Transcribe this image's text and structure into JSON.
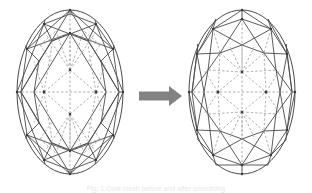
{
  "figure": {
    "background_color": "#ffffff",
    "line_color": "#4a4a4a",
    "dashed_color": "#9a9a9a",
    "arrow_color": "#828282",
    "caption": "Fig. 1  Oval mesh before and after smoothing",
    "panels": [
      {
        "id": "before",
        "name": "left-oval-mesh",
        "label": "Initial oval triangular mesh",
        "mesh_density": "fine",
        "ellipse": {
          "cx": 70,
          "cy": 92,
          "rx": 53,
          "ry": 82
        },
        "rings": [
          1.0,
          0.78,
          0.5,
          0.22
        ],
        "sectors": 12,
        "node_count": 37
      },
      {
        "id": "after",
        "name": "right-oval-mesh",
        "label": "Smoothed oval triangular mesh",
        "mesh_density": "coarse",
        "ellipse": {
          "cx": 70,
          "cy": 92,
          "rx": 53,
          "ry": 82
        },
        "rings": [
          1.0,
          0.8,
          0.56,
          0.28
        ],
        "sectors": 12,
        "node_count": 31
      }
    ],
    "arrow": {
      "name": "transform-arrow",
      "direction": "right",
      "meaning": "transforms-into"
    }
  }
}
